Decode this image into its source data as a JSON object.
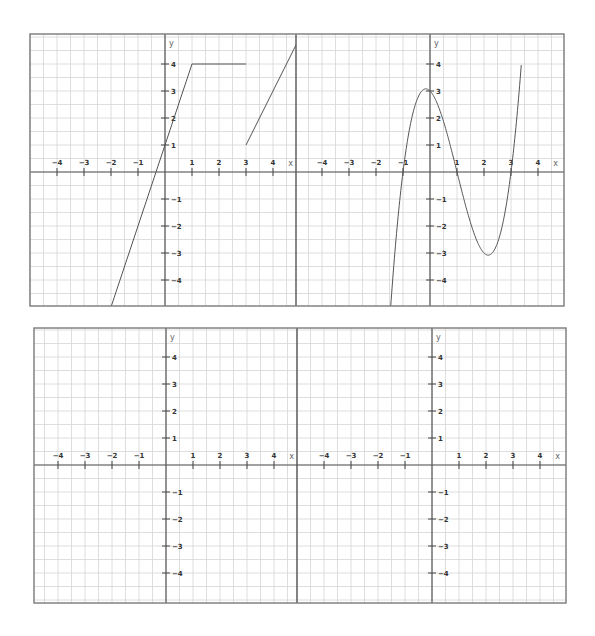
{
  "panels": [
    {
      "id": "top",
      "frame": {
        "left": 30,
        "top": 34,
        "right": 564,
        "bottom": 306
      },
      "divider_x": 296,
      "axis_y_px": 172,
      "graphs": [
        {
          "id": "top-left",
          "origin_x": 165,
          "label": "piecewise linear graph"
        },
        {
          "id": "top-right",
          "origin_x": 430,
          "label": "cubic graph"
        }
      ]
    },
    {
      "id": "bottom",
      "frame": {
        "left": 34,
        "top": 328,
        "right": 566,
        "bottom": 603
      },
      "divider_x": 297,
      "axis_y_px": 465,
      "graphs": [
        {
          "id": "bottom-left",
          "origin_x": 166,
          "label": "blank grid"
        },
        {
          "id": "bottom-right",
          "origin_x": 432,
          "label": "blank grid"
        }
      ]
    }
  ],
  "unit_px": 27,
  "axis_labels": {
    "x": "x",
    "y": "y"
  },
  "x_ticks": [
    -4,
    -3,
    -2,
    -1,
    1,
    2,
    3,
    4
  ],
  "y_ticks": [
    -4,
    -3,
    -2,
    -1,
    1,
    2,
    3,
    4
  ],
  "minor_grid_step": 0.5,
  "chart_data": [
    {
      "type": "line",
      "title": "",
      "panel": "top-left",
      "xlabel": "x",
      "ylabel": "y",
      "xlim": [
        -5,
        5
      ],
      "ylim": [
        -5,
        5
      ],
      "grid": true,
      "series": [
        {
          "name": "segment 1: y = 3x + 1",
          "x": [
            -2,
            1
          ],
          "y": [
            -5,
            4
          ]
        },
        {
          "name": "segment 2: y = 4",
          "x": [
            1,
            3
          ],
          "y": [
            4,
            4
          ]
        },
        {
          "name": "segment 3: y = 2x - 5",
          "x": [
            3,
            4.95
          ],
          "y": [
            1,
            4.9
          ]
        }
      ]
    },
    {
      "type": "line",
      "title": "",
      "panel": "top-right",
      "xlabel": "x",
      "ylabel": "y",
      "xlim": [
        -5,
        5
      ],
      "ylim": [
        -5,
        5
      ],
      "grid": true,
      "series": [
        {
          "name": "y = (x+1)(x-1)(x-3)",
          "x": [
            -1.45,
            -1,
            -0.5,
            -0.15,
            0,
            0.5,
            1,
            1.5,
            2,
            2.2,
            2.5,
            3,
            3.3
          ],
          "y": [
            -4.98,
            0,
            2.62,
            3.08,
            3,
            1.88,
            0,
            -1.88,
            -3,
            -3.07,
            -2.63,
            0,
            3.76
          ]
        }
      ],
      "annotations": [
        "roots at x = -1, 1, 3",
        "local max ≈ (-0.15, 3.08)",
        "local min ≈ (2.15, -3.08)"
      ]
    },
    {
      "type": "line",
      "title": "",
      "panel": "bottom-left",
      "xlabel": "x",
      "ylabel": "y",
      "xlim": [
        -5,
        5
      ],
      "ylim": [
        -5,
        5
      ],
      "grid": true,
      "series": []
    },
    {
      "type": "line",
      "title": "",
      "panel": "bottom-right",
      "xlabel": "x",
      "ylabel": "y",
      "xlim": [
        -5,
        5
      ],
      "ylim": [
        -5,
        5
      ],
      "grid": true,
      "series": []
    }
  ]
}
